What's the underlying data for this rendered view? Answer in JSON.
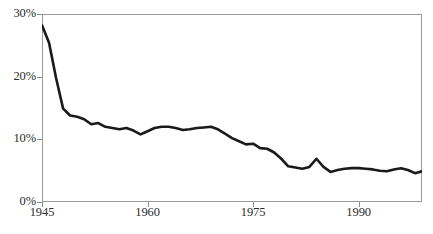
{
  "chart_data": {
    "type": "line",
    "title": "",
    "subtitle": "",
    "xlabel": "",
    "ylabel": "",
    "xlim": [
      1945,
      1999
    ],
    "ylim": [
      0,
      30
    ],
    "grid": false,
    "legend": null,
    "y_tick_labels": [
      "30%",
      "20%",
      "10%",
      "0%"
    ],
    "y_tick_values": [
      30,
      20,
      10,
      0
    ],
    "x_tick_labels": [
      "1945",
      "1960",
      "1975",
      "1990"
    ],
    "x_tick_values": [
      1945,
      1960,
      1975,
      1990
    ],
    "series": [
      {
        "name": "",
        "color": "#1a1a1a",
        "x": [
          1945,
          1946,
          1947,
          1948,
          1949,
          1950,
          1951,
          1952,
          1953,
          1954,
          1955,
          1956,
          1957,
          1958,
          1959,
          1960,
          1961,
          1962,
          1963,
          1964,
          1965,
          1966,
          1967,
          1968,
          1969,
          1970,
          1971,
          1972,
          1973,
          1974,
          1975,
          1976,
          1977,
          1978,
          1979,
          1980,
          1981,
          1982,
          1983,
          1984,
          1985,
          1986,
          1987,
          1988,
          1989,
          1990,
          1991,
          1992,
          1993,
          1994,
          1995,
          1996,
          1997,
          1998,
          1999
        ],
        "values": [
          28.2,
          25.4,
          19.8,
          14.9,
          13.8,
          13.6,
          13.2,
          12.4,
          12.6,
          12.0,
          11.8,
          11.6,
          11.8,
          11.4,
          10.8,
          11.3,
          11.8,
          12.0,
          12.0,
          11.8,
          11.5,
          11.6,
          11.8,
          11.9,
          12.0,
          11.6,
          10.9,
          10.2,
          9.7,
          9.2,
          9.3,
          8.6,
          8.5,
          7.9,
          6.9,
          5.7,
          5.5,
          5.3,
          5.6,
          6.9,
          5.6,
          4.8,
          5.1,
          5.3,
          5.4,
          5.4,
          5.3,
          5.2,
          5.0,
          4.9,
          5.2,
          5.4,
          5.1,
          4.6,
          4.9
        ]
      }
    ]
  },
  "axes": {
    "y_ticks": [
      {
        "label": "30%",
        "value": 30
      },
      {
        "label": "20%",
        "value": 20
      },
      {
        "label": "10%",
        "value": 10
      },
      {
        "label": "0%",
        "value": 0
      }
    ],
    "x_ticks": [
      {
        "label": "1945",
        "value": 1945
      },
      {
        "label": "1960",
        "value": 1960
      },
      {
        "label": "1975",
        "value": 1975
      },
      {
        "label": "1990",
        "value": 1990
      }
    ]
  },
  "style": {
    "line_color": "#1a1a1a",
    "frame_color": "#9a9a9a",
    "tick_color": "#8d8d8d",
    "text_color": "#2b2b2b",
    "background": "#ffffff"
  }
}
